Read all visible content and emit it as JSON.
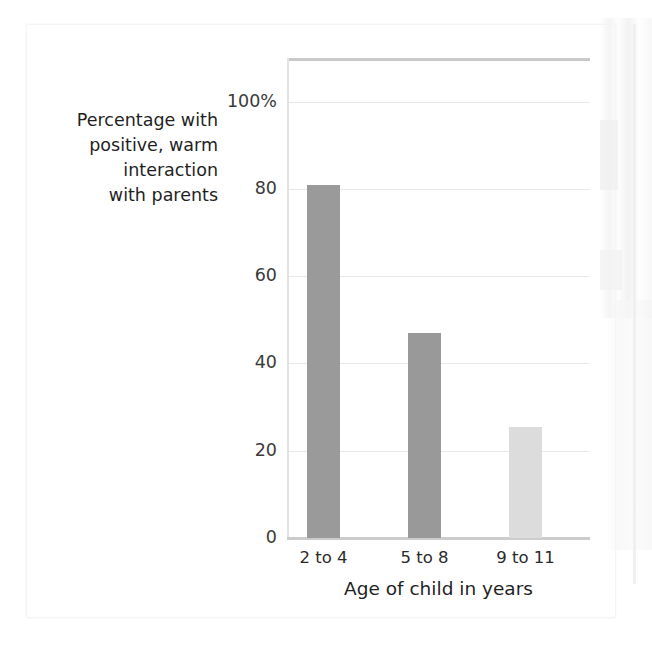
{
  "chart_data": {
    "type": "bar",
    "title": "",
    "subtitle": "",
    "categories": [
      "2 to 4",
      "5 to 8",
      "9 to 11"
    ],
    "values": [
      81,
      47,
      25.5
    ],
    "series": [
      {
        "name": "Percentage with positive, warm interaction with parents",
        "values": [
          81,
          47,
          25.5
        ]
      }
    ],
    "bar_colors": [
      "#9a9a9a",
      "#999999",
      "#dcdcdc"
    ],
    "xlabel": "Age of child in years",
    "ylabel": "Percentage with positive, warm interaction with parents",
    "ylabel_lines": "Percentage with\npositive, warm\ninteraction\nwith parents",
    "ylim": [
      0,
      110
    ],
    "yticks": [
      {
        "value": 0,
        "label": "0"
      },
      {
        "value": 20,
        "label": "20"
      },
      {
        "value": 40,
        "label": "40"
      },
      {
        "value": 60,
        "label": "60"
      },
      {
        "value": 80,
        "label": "80"
      },
      {
        "value": 100,
        "label": "100%"
      }
    ],
    "grid": true,
    "grid_axis": "y",
    "legend": false,
    "legend_position": "none",
    "annotations": []
  },
  "figure": {
    "background_color": "#ffffff",
    "plot_border_top_color": "#c9c9c9",
    "gridline_color": "#e8e8e8",
    "text_color": "#1f1f1f"
  }
}
